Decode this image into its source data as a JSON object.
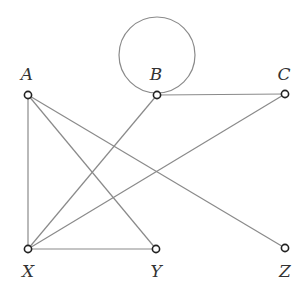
{
  "diagram": {
    "type": "graph",
    "directed": false,
    "colors": {
      "edge": "#8a8a8a",
      "node_stroke": "#222222",
      "node_fill": "#ffffff",
      "label": "#333333"
    },
    "nodes": [
      {
        "id": "A",
        "label": "A",
        "x": 28,
        "y": 95,
        "label_x": 27,
        "label_y": 80
      },
      {
        "id": "B",
        "label": "B",
        "x": 157,
        "y": 95,
        "label_x": 156,
        "label_y": 80
      },
      {
        "id": "C",
        "label": "C",
        "x": 285,
        "y": 94,
        "label_x": 284,
        "label_y": 80
      },
      {
        "id": "X",
        "label": "X",
        "x": 28,
        "y": 249,
        "label_x": 28,
        "label_y": 277
      },
      {
        "id": "Y",
        "label": "Y",
        "x": 156,
        "y": 249,
        "label_x": 156,
        "label_y": 277
      },
      {
        "id": "Z",
        "label": "Z",
        "x": 285,
        "y": 248,
        "label_x": 285,
        "label_y": 277
      }
    ],
    "edges": [
      {
        "from": "A",
        "to": "X"
      },
      {
        "from": "A",
        "to": "Y"
      },
      {
        "from": "A",
        "to": "Z"
      },
      {
        "from": "B",
        "to": "C"
      },
      {
        "from": "B",
        "to": "X"
      },
      {
        "from": "C",
        "to": "X"
      },
      {
        "from": "X",
        "to": "Y"
      }
    ],
    "loops": [
      {
        "node": "B",
        "cx": 157,
        "cy": 55,
        "r": 38
      }
    ]
  }
}
